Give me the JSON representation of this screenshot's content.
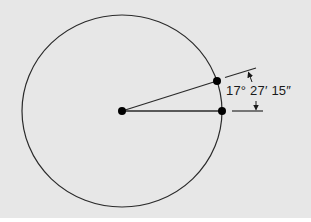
{
  "diagram": {
    "title": "",
    "angle_label": "17° 27′ 15″",
    "colors": {
      "background": "#e7e7e7",
      "stroke": "#2a2a2a",
      "dots": "#000000",
      "text": "#1a1a1a"
    },
    "shapes": {
      "circle": {
        "cx": 122,
        "cy": 111,
        "rx": 100,
        "ry": 96
      },
      "center_point": {
        "x": 122,
        "y": 111
      },
      "point_on_circle_upper": {
        "x": 217,
        "y": 81
      },
      "point_on_circle_horizontal": {
        "x": 222,
        "y": 111
      }
    }
  }
}
